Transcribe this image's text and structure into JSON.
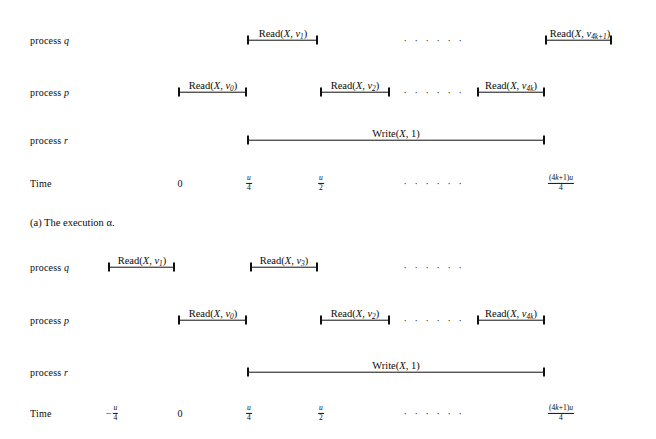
{
  "figure_a": {
    "caption": "(a) The execution α.",
    "rows": [
      {
        "name": "process-q",
        "label_prefix": "process ",
        "label_var": "q",
        "y": 40
      },
      {
        "name": "process-p",
        "label_prefix": "process ",
        "label_var": "p",
        "y": 92
      },
      {
        "name": "process-r",
        "label_prefix": "process ",
        "label_var": "r",
        "y": 140
      },
      {
        "name": "time-axis",
        "label_prefix": "Time",
        "label_var": "",
        "y": 183
      }
    ],
    "intervals": [
      {
        "row": "process-q",
        "op": "Read",
        "arg1": "X",
        "arg2": "v",
        "sub": "1",
        "x1": 247,
        "x2": 318,
        "label_x": 283,
        "label_y": 30
      },
      {
        "row": "process-q",
        "op": "Read",
        "arg1": "X",
        "arg2": "v",
        "sub": "4k+1",
        "x1": 545,
        "x2": 612,
        "label_x": 580,
        "label_y": 30
      },
      {
        "row": "process-p",
        "op": "Read",
        "arg1": "X",
        "arg2": "v",
        "sub": "0",
        "x1": 178,
        "x2": 247,
        "label_x": 213,
        "label_y": 82
      },
      {
        "row": "process-p",
        "op": "Read",
        "arg1": "X",
        "arg2": "v",
        "sub": "2",
        "x1": 320,
        "x2": 390,
        "label_x": 355,
        "label_y": 82
      },
      {
        "row": "process-p",
        "op": "Read",
        "arg1": "X",
        "arg2": "v",
        "sub": "4k",
        "x1": 477,
        "x2": 545,
        "label_x": 511,
        "label_y": 82
      },
      {
        "row": "process-r",
        "op": "Write",
        "arg1": "X",
        "arg2": "1",
        "sub": "",
        "x1": 247,
        "x2": 545,
        "label_x": 396,
        "label_y": 130
      }
    ],
    "ellipses": [
      {
        "row": "process-q",
        "x": 434,
        "y": 40,
        "text": "· · · · · ·"
      },
      {
        "row": "process-p",
        "x": 434,
        "y": 92,
        "text": "· · · · · ·"
      },
      {
        "row": "time-axis",
        "x": 434,
        "y": 183,
        "text": "· · · · · ·"
      }
    ],
    "ticks": [
      {
        "x": 180,
        "kind": "plain",
        "text": "0"
      },
      {
        "x": 249,
        "kind": "frac",
        "num": "u",
        "den": "4",
        "neg": false
      },
      {
        "x": 321,
        "kind": "frac",
        "num": "u",
        "den": "2",
        "neg": false
      },
      {
        "x": 561,
        "kind": "frac",
        "num": "(4k+1)u",
        "den": "4",
        "neg": false
      }
    ],
    "caption_x": 30,
    "caption_y": 222
  },
  "figure_b": {
    "rows": [
      {
        "name": "process-q",
        "label_prefix": "process ",
        "label_var": "q",
        "y": 267
      },
      {
        "name": "process-p",
        "label_prefix": "process ",
        "label_var": "p",
        "y": 320
      },
      {
        "name": "process-r",
        "label_prefix": "process ",
        "label_var": "r",
        "y": 372
      },
      {
        "name": "time-axis",
        "label_prefix": "Time",
        "label_var": "",
        "y": 413
      }
    ],
    "intervals": [
      {
        "row": "process-q",
        "op": "Read",
        "arg1": "X",
        "arg2": "v",
        "sub": "1",
        "x1": 108,
        "x2": 175,
        "label_x": 142,
        "label_y": 257
      },
      {
        "row": "process-q",
        "op": "Read",
        "arg1": "X",
        "arg2": "v",
        "sub": "3",
        "x1": 250,
        "x2": 318,
        "label_x": 284,
        "label_y": 257
      },
      {
        "row": "process-p",
        "op": "Read",
        "arg1": "X",
        "arg2": "v",
        "sub": "0",
        "x1": 178,
        "x2": 247,
        "label_x": 213,
        "label_y": 310
      },
      {
        "row": "process-p",
        "op": "Read",
        "arg1": "X",
        "arg2": "v",
        "sub": "2",
        "x1": 320,
        "x2": 390,
        "label_x": 355,
        "label_y": 310
      },
      {
        "row": "process-p",
        "op": "Read",
        "arg1": "X",
        "arg2": "v",
        "sub": "4k",
        "x1": 477,
        "x2": 545,
        "label_x": 511,
        "label_y": 310
      },
      {
        "row": "process-r",
        "op": "Write",
        "arg1": "X",
        "arg2": "1",
        "sub": "",
        "x1": 247,
        "x2": 545,
        "label_x": 396,
        "label_y": 362
      }
    ],
    "ellipses": [
      {
        "row": "process-q",
        "x": 434,
        "y": 267,
        "text": "· · · · · ·"
      },
      {
        "row": "process-p",
        "x": 434,
        "y": 320,
        "text": "· · · · · ·"
      },
      {
        "row": "time-axis",
        "x": 434,
        "y": 413,
        "text": "· · · · · ·"
      }
    ],
    "ticks": [
      {
        "x": 112,
        "kind": "frac",
        "num": "u",
        "den": "4",
        "neg": true
      },
      {
        "x": 180,
        "kind": "plain",
        "text": "0"
      },
      {
        "x": 249,
        "kind": "frac",
        "num": "u",
        "den": "4",
        "neg": false
      },
      {
        "x": 321,
        "kind": "frac",
        "num": "u",
        "den": "2",
        "neg": false
      },
      {
        "x": 561,
        "kind": "frac",
        "num": "(4k+1)u",
        "den": "4",
        "neg": false
      }
    ]
  }
}
